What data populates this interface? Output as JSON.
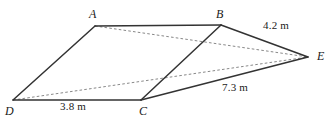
{
  "figure": {
    "kind": "geometry-diagram",
    "stroke_color": "#333333",
    "dash_color": "#7a7a7a",
    "background_color": "#ffffff",
    "width": 332,
    "height": 121,
    "vertices": [
      {
        "id": "A",
        "label": "A",
        "x": 95,
        "y": 26,
        "label_x": 89,
        "label_y": 8
      },
      {
        "id": "B",
        "label": "B",
        "x": 221,
        "y": 25,
        "label_x": 216,
        "label_y": 8
      },
      {
        "id": "C",
        "label": "C",
        "x": 141,
        "y": 100,
        "label_x": 139,
        "label_y": 106
      },
      {
        "id": "D",
        "label": "D",
        "x": 13,
        "y": 100,
        "label_x": 6,
        "label_y": 106
      },
      {
        "id": "E",
        "label": "E",
        "x": 308,
        "y": 57,
        "label_x": 316,
        "label_y": 50
      }
    ],
    "solid_edges": [
      {
        "name": "edge-A-B",
        "from": "A",
        "to": "B"
      },
      {
        "name": "edge-D-A",
        "from": "D",
        "to": "A"
      },
      {
        "name": "edge-D-C",
        "from": "D",
        "to": "C"
      },
      {
        "name": "edge-C-B",
        "from": "C",
        "to": "B"
      },
      {
        "name": "edge-B-E",
        "from": "B",
        "to": "E"
      },
      {
        "name": "edge-C-E",
        "from": "C",
        "to": "E"
      }
    ],
    "dashed_edges": [
      {
        "name": "diagonal-A-E",
        "from": "A",
        "to": "E"
      },
      {
        "name": "diagonal-D-E",
        "from": "D",
        "to": "E"
      }
    ],
    "length_labels": [
      {
        "name": "length-B-E",
        "text": "4.2 m",
        "x": 263,
        "y": 21
      },
      {
        "name": "length-C-E",
        "text": "7.3 m",
        "x": 222,
        "y": 82
      },
      {
        "name": "length-D-C",
        "text": "3.8 m",
        "x": 60,
        "y": 101
      }
    ]
  }
}
